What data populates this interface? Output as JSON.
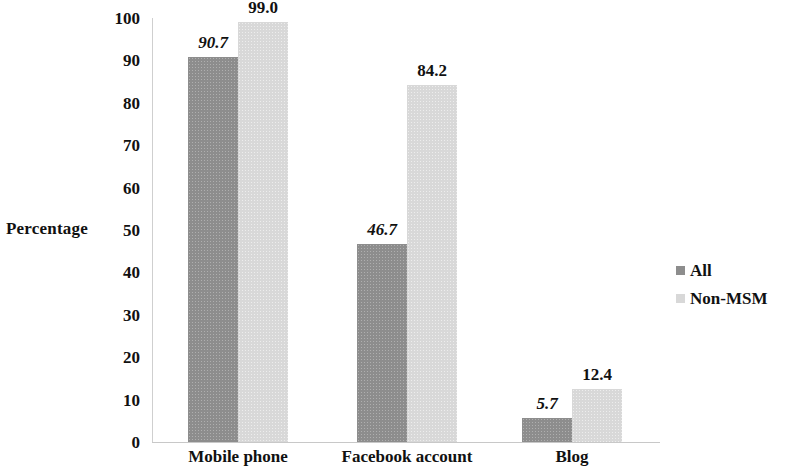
{
  "chart_data": {
    "type": "bar",
    "title": "",
    "subtitle": "",
    "xlabel": "",
    "ylabel": "Percentage",
    "ylim": [
      0,
      100
    ],
    "ytick_labels": [
      "100",
      "90",
      "80",
      "70",
      "60",
      "50",
      "40",
      "30",
      "20",
      "10",
      "0"
    ],
    "yticks": [
      100,
      90,
      80,
      70,
      60,
      50,
      40,
      30,
      20,
      10,
      0
    ],
    "grid": false,
    "legend_position": "right",
    "categories": [
      "Mobile phone",
      "Facebook account",
      "Blog"
    ],
    "series": [
      {
        "name": "All",
        "color": "#8d8d8d",
        "values": [
          90.7,
          46.7,
          5.7
        ],
        "value_labels": [
          "90.7",
          "46.7",
          "5.7"
        ]
      },
      {
        "name": "Non-MSM",
        "color": "#d8d8d8",
        "values": [
          99.0,
          84.2,
          12.4
        ],
        "value_labels": [
          "99.0",
          "84.2",
          "12.4"
        ]
      }
    ]
  }
}
